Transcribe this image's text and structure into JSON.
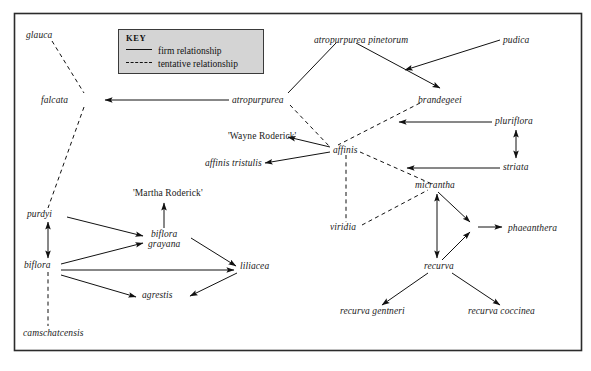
{
  "figure": {
    "type": "relationship-diagram",
    "title": "",
    "border": {
      "color": "#2b2b2b"
    }
  },
  "key": {
    "title": "KEY",
    "firm_label": "firm relationship",
    "tentative_label": "tentative relationship",
    "background": "#d4d4d4",
    "border_color": "#3a3a3a"
  },
  "nodes": [
    {
      "id": "glauca",
      "label": "glauca",
      "style": "italic",
      "x": 26,
      "y": 30
    },
    {
      "id": "falcata",
      "label": "falcata",
      "style": "italic",
      "x": 41,
      "y": 95
    },
    {
      "id": "atropurpurea",
      "label": "atropurpurea",
      "style": "italic",
      "x": 232,
      "y": 95
    },
    {
      "id": "atropurpurea_pinetorum",
      "label": "atropurpurea pinetorum",
      "style": "italic",
      "x": 314,
      "y": 35
    },
    {
      "id": "pudica",
      "label": "pudica",
      "style": "italic",
      "x": 503,
      "y": 35
    },
    {
      "id": "brandegeei",
      "label": "brandegeei",
      "style": "italic",
      "x": 418,
      "y": 95
    },
    {
      "id": "pluriflora",
      "label": "pluriflora",
      "style": "italic",
      "x": 495,
      "y": 118
    },
    {
      "id": "striata",
      "label": "striata",
      "style": "italic",
      "x": 503,
      "y": 164
    },
    {
      "id": "wayne_roderick",
      "label": "'Wayne Roderick'",
      "style": "normal",
      "x": 228,
      "y": 135
    },
    {
      "id": "affinis_tristulis",
      "label": "affinis tristulis",
      "style": "italic",
      "x": 205,
      "y": 163
    },
    {
      "id": "affinis",
      "label": "affinis",
      "style": "italic",
      "x": 333,
      "y": 150
    },
    {
      "id": "micrantha",
      "label": "micrantha",
      "style": "italic",
      "x": 415,
      "y": 186
    },
    {
      "id": "viridia",
      "label": "viridia",
      "style": "italic",
      "x": 330,
      "y": 227
    },
    {
      "id": "phaeanthera",
      "label": "phaeanthera",
      "style": "italic",
      "x": 508,
      "y": 228
    },
    {
      "id": "recurva",
      "label": "recurva",
      "style": "italic",
      "x": 424,
      "y": 266
    },
    {
      "id": "recurva_gentneri",
      "label": "recurva gentneri",
      "style": "italic",
      "x": 340,
      "y": 311
    },
    {
      "id": "recurva_coccinea",
      "label": "recurva coccinea",
      "style": "italic",
      "x": 468,
      "y": 311
    },
    {
      "id": "martha_roderick",
      "label": "'Martha Roderick'",
      "style": "normal",
      "x": 133,
      "y": 192
    },
    {
      "id": "purdyi",
      "label": "purdyi",
      "style": "italic",
      "x": 27,
      "y": 214
    },
    {
      "id": "biflora",
      "label": "biflora",
      "style": "italic",
      "x": 24,
      "y": 265
    },
    {
      "id": "biflora_grayana",
      "label": "biflora\ngrayana",
      "style": "italic",
      "x": 148,
      "y": 230
    },
    {
      "id": "liliacea",
      "label": "liliacea",
      "style": "italic",
      "x": 240,
      "y": 265
    },
    {
      "id": "agrestis",
      "label": "agrestis",
      "style": "italic",
      "x": 142,
      "y": 295
    },
    {
      "id": "camschatcensis",
      "label": "camschatcensis",
      "style": "italic",
      "x": 23,
      "y": 333
    }
  ],
  "edges": [
    {
      "from": "glauca",
      "to": "falcata",
      "relationship": "tentative",
      "arrow": "none"
    },
    {
      "from": "falcata",
      "to": "purdyi",
      "relationship": "tentative",
      "arrow": "none"
    },
    {
      "from": "atropurpurea",
      "to": "falcata",
      "relationship": "firm",
      "arrow": "single"
    },
    {
      "from": "atropurpurea",
      "to": "atropurpurea_pinetorum",
      "relationship": "firm",
      "arrow": "none"
    },
    {
      "from": "atropurpurea",
      "to": "affinis",
      "relationship": "tentative",
      "arrow": "none"
    },
    {
      "from": "atropurpurea_pinetorum",
      "to": "brandegeei",
      "relationship": "firm",
      "arrow": "single"
    },
    {
      "from": "pudica",
      "to": "atropurpurea_pinetorum",
      "relationship": "firm",
      "arrow": "single"
    },
    {
      "from": "brandegeei",
      "to": "affinis",
      "relationship": "tentative",
      "arrow": "none"
    },
    {
      "from": "pluriflora",
      "to": "brandegeei",
      "relationship": "firm",
      "arrow": "single"
    },
    {
      "from": "striata",
      "to": "affinis",
      "relationship": "firm",
      "arrow": "single"
    },
    {
      "from": "pluriflora",
      "to": "striata",
      "relationship": "firm",
      "arrow": "double"
    },
    {
      "from": "affinis",
      "to": "wayne_roderick",
      "relationship": "firm",
      "arrow": "single"
    },
    {
      "from": "affinis",
      "to": "affinis_tristulis",
      "relationship": "firm",
      "arrow": "single"
    },
    {
      "from": "affinis",
      "to": "viridia",
      "relationship": "tentative",
      "arrow": "none"
    },
    {
      "from": "affinis",
      "to": "micrantha",
      "relationship": "tentative",
      "arrow": "none"
    },
    {
      "from": "viridia",
      "to": "micrantha",
      "relationship": "tentative",
      "arrow": "none"
    },
    {
      "from": "micrantha",
      "to": "phaeanthera",
      "relationship": "firm",
      "arrow": "single"
    },
    {
      "from": "micrantha",
      "to": "recurva",
      "relationship": "firm",
      "arrow": "double"
    },
    {
      "from": "recurva",
      "to": "phaeanthera",
      "relationship": "firm",
      "arrow": "single"
    },
    {
      "from": "recurva",
      "to": "recurva_gentneri",
      "relationship": "firm",
      "arrow": "single"
    },
    {
      "from": "recurva",
      "to": "recurva_coccinea",
      "relationship": "firm",
      "arrow": "single"
    },
    {
      "from": "purdyi",
      "to": "biflora",
      "relationship": "firm",
      "arrow": "double"
    },
    {
      "from": "purdyi",
      "to": "biflora_grayana",
      "relationship": "firm",
      "arrow": "single"
    },
    {
      "from": "biflora",
      "to": "biflora_grayana",
      "relationship": "firm",
      "arrow": "single"
    },
    {
      "from": "biflora",
      "to": "liliacea",
      "relationship": "firm",
      "arrow": "single"
    },
    {
      "from": "biflora",
      "to": "agrestis",
      "relationship": "firm",
      "arrow": "single"
    },
    {
      "from": "biflora_grayana",
      "to": "liliacea",
      "relationship": "firm",
      "arrow": "single"
    },
    {
      "from": "biflora_grayana",
      "to": "martha_roderick",
      "relationship": "firm",
      "arrow": "single"
    },
    {
      "from": "liliacea",
      "to": "agrestis",
      "relationship": "firm",
      "arrow": "single"
    },
    {
      "from": "biflora",
      "to": "camschatcensis",
      "relationship": "tentative",
      "arrow": "none"
    }
  ]
}
